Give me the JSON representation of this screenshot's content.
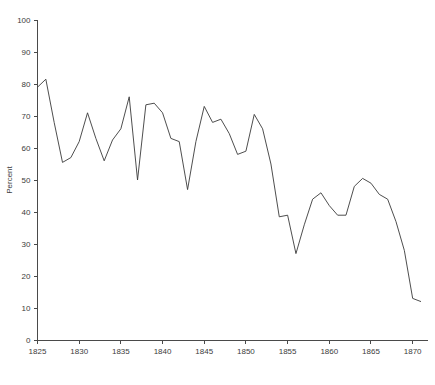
{
  "chart_data": {
    "type": "line",
    "title": "",
    "subtitle": "",
    "xlabel": "",
    "ylabel": "Percent",
    "xlim": [
      1825,
      1871
    ],
    "ylim": [
      0,
      100
    ],
    "grid": false,
    "legend": null,
    "x_ticks": [
      1825,
      1830,
      1835,
      1840,
      1845,
      1850,
      1855,
      1860,
      1865,
      1870
    ],
    "y_ticks": [
      0,
      10,
      20,
      30,
      40,
      50,
      60,
      70,
      80,
      90,
      100
    ],
    "series": [
      {
        "name": "Percent",
        "color": "#3a3a3a",
        "x": [
          1825,
          1826,
          1827,
          1828,
          1829,
          1830,
          1831,
          1832,
          1833,
          1834,
          1835,
          1836,
          1837,
          1838,
          1839,
          1840,
          1841,
          1842,
          1843,
          1844,
          1845,
          1846,
          1847,
          1848,
          1849,
          1850,
          1851,
          1852,
          1853,
          1854,
          1855,
          1856,
          1857,
          1858,
          1859,
          1860,
          1861,
          1862,
          1863,
          1864,
          1865,
          1866,
          1867,
          1868,
          1869,
          1870,
          1871
        ],
        "values": [
          79,
          81.5,
          68,
          55.5,
          57,
          62,
          71,
          63,
          56,
          62.5,
          66,
          76,
          50,
          73.5,
          74,
          71,
          63,
          62,
          47,
          62,
          73,
          68,
          69,
          64.5,
          58,
          59,
          70.5,
          66,
          55,
          38.5,
          39,
          27,
          36,
          44,
          46,
          42,
          39,
          39,
          48,
          50.5,
          49,
          45.5,
          44,
          37,
          28,
          13,
          12
        ]
      }
    ]
  },
  "axes": {
    "y_axis_label": "Percent"
  }
}
